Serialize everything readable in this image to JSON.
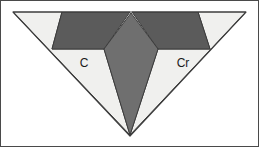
{
  "figure": {
    "width": 259,
    "height": 147,
    "background_color": "#ffffff",
    "frame_color": "#4a4a4a"
  },
  "colors": {
    "light_region": "#f0f0ee",
    "mid_gray_region": "#6f6f6f",
    "dark_gray_region": "#5b5b5b",
    "outline": "#3c3c3c",
    "label_text": "#1a1a1a"
  },
  "labels": {
    "left": "C",
    "right": "Cr"
  },
  "geometry": {
    "outer_triangle": {
      "name": "inverted-triangle",
      "points": "13,12 246,12 130,136"
    },
    "center_kite": {
      "name": "center-kite",
      "points": "131,13 158,49 130,135 104,49"
    },
    "left_dark_wedge": {
      "name": "left-dark-wedge",
      "points": "62,12 130,12 104,49 52,49"
    },
    "right_dark_wedge": {
      "name": "right-dark-wedge",
      "points": "132,12 198,12 210,49 158,49"
    },
    "left_light_region": {
      "name": "left-light-region",
      "points": "13,12 62,12 52,49 104,49 130,135"
    },
    "right_light_region": {
      "name": "right-light-region",
      "points": "198,12 246,12 130,135 158,49 210,49"
    },
    "label_left_pos": {
      "x": 84,
      "y": 64
    },
    "label_right_pos": {
      "x": 183,
      "y": 64
    }
  }
}
